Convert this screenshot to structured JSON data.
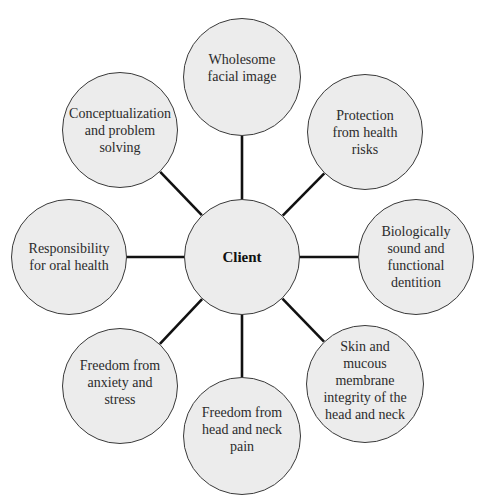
{
  "diagram": {
    "type": "hub-and-spoke",
    "colors": {
      "node_fill": "#ececec",
      "node_border": "#3a3a3a",
      "connector": "#111111",
      "text": "#2b2b2b"
    },
    "center": {
      "label": "Client",
      "cx": 242,
      "cy": 257,
      "r": 58
    },
    "nodes": [
      {
        "label": "Wholesome\nfacial image",
        "cx": 242,
        "cy": 77,
        "r": 59
      },
      {
        "label": "Protection\nfrom health\nrisks",
        "cx": 365,
        "cy": 132,
        "r": 58
      },
      {
        "label": "Biologically\nsound and\nfunctional\ndentition",
        "cx": 416,
        "cy": 257,
        "r": 58
      },
      {
        "label": "Skin and\nmucous\nmembrane\nintegrity of the\nhead and neck",
        "cx": 365,
        "cy": 384,
        "r": 59
      },
      {
        "label": "Freedom from\nhead and neck\npain",
        "cx": 242,
        "cy": 436,
        "r": 59
      },
      {
        "label": "Freedom from\nanxiety and\nstress",
        "cx": 120,
        "cy": 386,
        "r": 58
      },
      {
        "label": "Responsibility\nfor oral health",
        "cx": 69,
        "cy": 257,
        "r": 58
      },
      {
        "label": "Conceptualization\nand problem solving",
        "cx": 120,
        "cy": 130,
        "r": 58
      }
    ]
  }
}
